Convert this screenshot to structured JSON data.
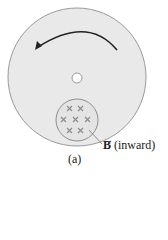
{
  "figure": {
    "label": "(a)",
    "field_symbol": "B",
    "field_direction": "(inward)",
    "field_marker_icon": "cross-x-icon",
    "rotation_arrow": "counterclockwise-arrow-icon",
    "colors": {
      "disc_fill": "#e9e9e9",
      "disc_stroke": "#9a9a9a",
      "arrow": "#222222",
      "cross": "#8a8a8a",
      "hole": "#ffffff"
    }
  }
}
